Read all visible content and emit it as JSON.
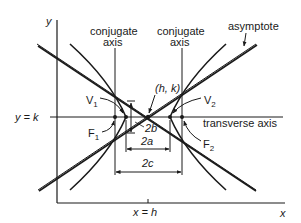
{
  "diagram": {
    "type": "hyperbola",
    "axes": {
      "x_label": "x",
      "y_label": "y"
    },
    "labels": {
      "conjugate_axis_left_line1": "conjugate",
      "conjugate_axis_left_line2": "axis",
      "conjugate_axis_right_line1": "conjugate",
      "conjugate_axis_right_line2": "axis",
      "asymptote": "asymptote",
      "center": "(h, k)",
      "vertex_left": "V",
      "vertex_left_sub": "1",
      "vertex_right": "V",
      "vertex_right_sub": "2",
      "focus_left": "F",
      "focus_left_sub": "1",
      "focus_right": "F",
      "focus_right_sub": "2",
      "horizontal_line": "y = k",
      "vertical_line": "x = h",
      "transverse_axis": "transverse axis",
      "dim_2b": "2b",
      "dim_2a": "2a",
      "dim_2c": "2c"
    },
    "colors": {
      "ink": "#1a1a1a",
      "background": "#ffffff"
    }
  }
}
